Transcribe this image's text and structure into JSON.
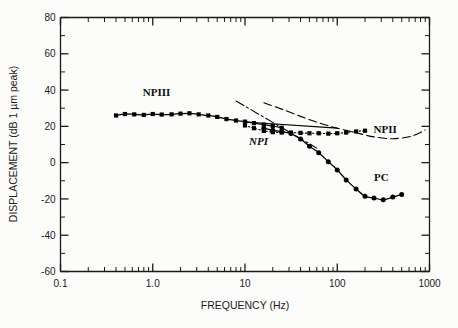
{
  "chart_data": {
    "type": "line",
    "title": "",
    "xlabel": "FREQUENCY (Hz)",
    "ylabel": "DISPLACEMENT (dB 1 µm peak)",
    "xscale": "log",
    "yscale": "linear",
    "xlim": [
      0.1,
      1000
    ],
    "ylim": [
      -60,
      80
    ],
    "grid": false,
    "legend_position": "inline-annotations",
    "xticks": [
      {
        "value": 0.1,
        "label": "0.1"
      },
      {
        "value": 1.0,
        "label": "1.0"
      },
      {
        "value": 10,
        "label": "10"
      },
      {
        "value": 100,
        "label": "100"
      },
      {
        "value": 1000,
        "label": "1000"
      }
    ],
    "yticks": [
      {
        "value": 80,
        "label": "80"
      },
      {
        "value": 70,
        "label": ""
      },
      {
        "value": 60,
        "label": "60"
      },
      {
        "value": 50,
        "label": ""
      },
      {
        "value": 40,
        "label": "40"
      },
      {
        "value": 30,
        "label": ""
      },
      {
        "value": 20,
        "label": "20"
      },
      {
        "value": 10,
        "label": ""
      },
      {
        "value": 0,
        "label": "0"
      },
      {
        "value": -10,
        "label": ""
      },
      {
        "value": -20,
        "label": "-20"
      },
      {
        "value": -30,
        "label": ""
      },
      {
        "value": -40,
        "label": "-40"
      },
      {
        "value": -50,
        "label": ""
      },
      {
        "value": -60,
        "label": "-60"
      }
    ],
    "series": [
      {
        "name": "NPIII",
        "style": "solid-with-markers",
        "marker": "filled-square",
        "color": "#000000",
        "points": [
          [
            0.4,
            26.0
          ],
          [
            0.5,
            26.8
          ],
          [
            0.63,
            26.6
          ],
          [
            0.8,
            26.3
          ],
          [
            1.0,
            26.8
          ],
          [
            1.25,
            26.5
          ],
          [
            1.6,
            26.6
          ],
          [
            2.0,
            27.0
          ],
          [
            2.5,
            27.2
          ],
          [
            3.15,
            26.6
          ],
          [
            4.0,
            26.0
          ],
          [
            5.0,
            25.2
          ],
          [
            6.3,
            24.0
          ],
          [
            8.0,
            23.2
          ],
          [
            10.0,
            22.6
          ],
          [
            12.5,
            21.8
          ],
          [
            16.0,
            21.0
          ],
          [
            20.0,
            20.2
          ],
          [
            25.0,
            19.2
          ]
        ]
      },
      {
        "name": "NPIII-extension",
        "style": "solid",
        "marker": "none",
        "color": "#000000",
        "points": [
          [
            10.0,
            22.4
          ],
          [
            100.0,
            19.0
          ]
        ]
      },
      {
        "name": "NPI",
        "style": "dotted-with-markers",
        "marker": "filled-square",
        "color": "#000000",
        "points": [
          [
            10.0,
            20.5
          ],
          [
            12.5,
            19.0
          ],
          [
            16.0,
            17.5
          ],
          [
            20.0,
            16.8
          ],
          [
            25.0,
            16.6
          ],
          [
            31.5,
            16.6
          ],
          [
            40.0,
            16.4
          ],
          [
            50.0,
            16.2
          ],
          [
            63.0,
            16.2
          ],
          [
            80.0,
            16.0
          ],
          [
            100.0,
            16.2
          ],
          [
            125.0,
            16.6
          ],
          [
            160.0,
            17.2
          ],
          [
            200.0,
            17.6
          ]
        ]
      },
      {
        "name": "NPI-fit",
        "style": "dash-dot",
        "marker": "none",
        "color": "#000000",
        "points": [
          [
            8.0,
            34.0
          ],
          [
            60.0,
            8.0
          ]
        ]
      },
      {
        "name": "NPII",
        "style": "long-dash",
        "marker": "none",
        "color": "#000000",
        "points": [
          [
            16.0,
            33.0
          ],
          [
            25.0,
            29.5
          ],
          [
            40.0,
            25.5
          ],
          [
            63.0,
            22.0
          ],
          [
            100.0,
            19.0
          ],
          [
            160.0,
            16.5
          ],
          [
            250.0,
            14.2
          ],
          [
            400.0,
            13.2
          ],
          [
            630.0,
            14.5
          ],
          [
            900.0,
            18.0
          ]
        ]
      },
      {
        "name": "PC",
        "style": "solid-with-markers",
        "marker": "filled-circle",
        "color": "#000000",
        "points": [
          [
            16.0,
            19.0
          ],
          [
            20.0,
            17.8
          ],
          [
            25.0,
            17.0
          ],
          [
            31.5,
            16.0
          ],
          [
            40.0,
            13.0
          ],
          [
            50.0,
            9.0
          ],
          [
            63.0,
            5.5
          ],
          [
            80.0,
            0.5
          ],
          [
            100.0,
            -4.0
          ],
          [
            125.0,
            -9.5
          ],
          [
            160.0,
            -14.5
          ],
          [
            200.0,
            -18.5
          ],
          [
            250.0,
            -19.5
          ],
          [
            315.0,
            -20.5
          ],
          [
            400.0,
            -19.0
          ],
          [
            500.0,
            -17.5
          ]
        ]
      }
    ],
    "annotations": [
      {
        "text": "NPIII",
        "x": 1.1,
        "y": 37.0,
        "name": "annotation-npiii"
      },
      {
        "text": "NPI",
        "x": 14.0,
        "y": 10.0,
        "name": "annotation-npi"
      },
      {
        "text": "NPII",
        "x": 330.0,
        "y": 16.5,
        "name": "annotation-npii"
      },
      {
        "text": "PC",
        "x": 300.0,
        "y": -10.0,
        "name": "annotation-pc"
      }
    ]
  }
}
